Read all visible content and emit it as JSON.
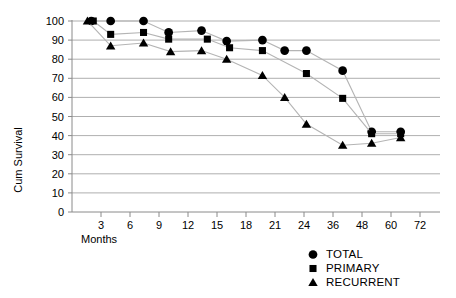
{
  "chart_data": {
    "type": "line",
    "title": "",
    "xlabel": "Months",
    "ylabel": "Cum Survival",
    "ylim": [
      0,
      100
    ],
    "ytick_labels": [
      "0",
      "10",
      "20",
      "30",
      "40",
      "50",
      "60",
      "70",
      "80",
      "90",
      "100"
    ],
    "ytick_values": [
      0,
      10,
      20,
      30,
      40,
      50,
      60,
      70,
      80,
      90,
      100
    ],
    "xtick_labels": [
      "3",
      "6",
      "9",
      "12",
      "15",
      "18",
      "21",
      "24",
      "36",
      "48",
      "60",
      "72"
    ],
    "xtick_values": [
      3,
      6,
      9,
      12,
      15,
      18,
      21,
      24,
      36,
      48,
      60,
      72
    ],
    "x_axis_note": "categorical-even-spacing",
    "grid": "horizontal",
    "legend_position": "bottom-right",
    "series": [
      {
        "name": "TOTAL",
        "marker": "circle",
        "points": [
          {
            "x": 2.0,
            "y": 100
          },
          {
            "x": 4.0,
            "y": 100
          },
          {
            "x": 7.4,
            "y": 100
          },
          {
            "x": 10.0,
            "y": 94
          },
          {
            "x": 13.4,
            "y": 95
          },
          {
            "x": 16.0,
            "y": 89.5
          },
          {
            "x": 19.7,
            "y": 90
          },
          {
            "x": 22.0,
            "y": 84.5
          },
          {
            "x": 25.0,
            "y": 84.5
          },
          {
            "x": 40.0,
            "y": 74
          },
          {
            "x": 52.0,
            "y": 42
          },
          {
            "x": 64.0,
            "y": 42
          }
        ]
      },
      {
        "name": "PRIMARY",
        "marker": "square",
        "points": [
          {
            "x": 2.2,
            "y": 100
          },
          {
            "x": 4.0,
            "y": 93
          },
          {
            "x": 7.4,
            "y": 94
          },
          {
            "x": 10.0,
            "y": 90.5
          },
          {
            "x": 14.0,
            "y": 90.5
          },
          {
            "x": 16.3,
            "y": 86
          },
          {
            "x": 19.7,
            "y": 84.5
          },
          {
            "x": 25.0,
            "y": 72.5
          },
          {
            "x": 40.0,
            "y": 59.5
          },
          {
            "x": 52.0,
            "y": 41
          },
          {
            "x": 64.0,
            "y": 41
          }
        ]
      },
      {
        "name": "RECURRENT",
        "marker": "triangle",
        "points": [
          {
            "x": 1.6,
            "y": 100
          },
          {
            "x": 4.0,
            "y": 87
          },
          {
            "x": 7.4,
            "y": 88.5
          },
          {
            "x": 10.2,
            "y": 84
          },
          {
            "x": 13.4,
            "y": 84.5
          },
          {
            "x": 16.0,
            "y": 80
          },
          {
            "x": 19.7,
            "y": 71.5
          },
          {
            "x": 22.0,
            "y": 60
          },
          {
            "x": 25.0,
            "y": 46
          },
          {
            "x": 40.0,
            "y": 35
          },
          {
            "x": 52.0,
            "y": 36
          },
          {
            "x": 64.0,
            "y": 39
          }
        ]
      }
    ]
  },
  "axes": {
    "y_title": "Cum Survival",
    "x_title": "Months"
  },
  "legend": {
    "items": [
      {
        "label": "TOTAL",
        "marker": "circle-marker-icon"
      },
      {
        "label": "PRIMARY",
        "marker": "square-marker-icon"
      },
      {
        "label": "RECURRENT",
        "marker": "triangle-marker-icon"
      }
    ]
  }
}
